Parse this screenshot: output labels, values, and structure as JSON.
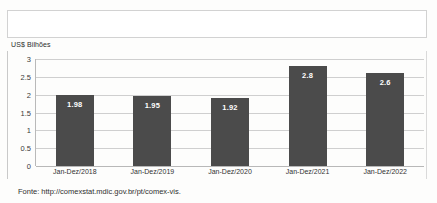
{
  "chart_data": {
    "type": "bar",
    "title": "",
    "xlabel": "",
    "ylabel": "US$ Bilhões",
    "ylim": [
      0,
      3
    ],
    "yticks": [
      "3",
      "2.5",
      "2",
      "1.5",
      "1",
      "0.5",
      "0"
    ],
    "ytick_values": [
      3,
      2.5,
      2,
      1.5,
      1,
      0.5,
      0
    ],
    "grid": true,
    "legend": "none",
    "categories": [
      "Jan-Dez/2018",
      "Jan-Dez/2019",
      "Jan-Dez/2020",
      "Jan-Dez/2021",
      "Jan-Dez/2022"
    ],
    "values": [
      1.98,
      1.95,
      1.92,
      2.8,
      2.6
    ],
    "data_labels": [
      "1.98",
      "1.95",
      "1.92",
      "2.8",
      "2.6"
    ],
    "bar_color": "#4b4b4b",
    "data_label_color": "#ffffff",
    "gridline_color": "#cfcfcf"
  },
  "footer": {
    "source": "Fonte: http://comexstat.mdic.gov.br/pt/comex-vis."
  },
  "top_box": {
    "content": ""
  }
}
